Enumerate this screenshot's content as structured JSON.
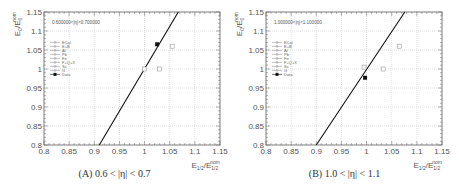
{
  "chart_data": [
    {
      "type": "scatter",
      "panel": "A",
      "caption": "(A) 0.6 < |η| < 0.7",
      "annotation": "0.600000<|η|<0.700000",
      "xlabel": "E1/2/E1/2^nom",
      "ylabel": "E0/E0^nom",
      "xlim": [
        0.8,
        1.15
      ],
      "ylim": [
        0.8,
        1.15
      ],
      "xticks": [
        "0.8",
        "0.85",
        "0.9",
        "0.95",
        "1",
        "1.05",
        "1.1",
        "1.15"
      ],
      "yticks": [
        "0.8",
        "0.85",
        "0.9",
        "0.95",
        "1",
        "1.05",
        "1.1",
        "1.15"
      ],
      "grid": true,
      "legend_position": "upper-left",
      "legend": [
        "ECal",
        "E+B",
        "Al",
        "Pb",
        "Fe",
        "F+Q+X",
        "Sc",
        "G",
        "Data"
      ],
      "line": {
        "x": [
          0.91,
          1.067
        ],
        "y": [
          0.8,
          1.15
        ]
      },
      "points_open": [
        {
          "x": 1.0,
          "y": 1.0
        },
        {
          "x": 1.03,
          "y": 1.0
        },
        {
          "x": 1.055,
          "y": 1.06
        }
      ],
      "points_filled": [
        {
          "x": 1.025,
          "y": 1.065
        }
      ]
    },
    {
      "type": "scatter",
      "panel": "B",
      "caption": "(B) 1.0 < |η| < 1.1",
      "annotation": "1.000000<|η|<1.100000",
      "xlabel": "E1/2/E1/2^nom",
      "ylabel": "E0/E0^nom",
      "xlim": [
        0.8,
        1.15
      ],
      "ylim": [
        0.8,
        1.15
      ],
      "xticks": [
        "0.8",
        "0.85",
        "0.9",
        "0.95",
        "1",
        "1.05",
        "1.1",
        "1.15"
      ],
      "yticks": [
        "0.8",
        "0.85",
        "0.9",
        "0.95",
        "1",
        "1.05",
        "1.1",
        "1.15"
      ],
      "grid": true,
      "legend_position": "upper-left",
      "legend": [
        "ECal",
        "E+B",
        "Al",
        "Pb",
        "Fe",
        "F+Q+X",
        "Sc",
        "G",
        "Data"
      ],
      "line": {
        "x": [
          0.9,
          1.076
        ],
        "y": [
          0.8,
          1.15
        ]
      },
      "points_open": [
        {
          "x": 0.995,
          "y": 1.005
        },
        {
          "x": 1.033,
          "y": 1.0
        },
        {
          "x": 1.065,
          "y": 1.06
        }
      ],
      "points_filled": [
        {
          "x": 0.997,
          "y": 0.977
        }
      ]
    }
  ]
}
